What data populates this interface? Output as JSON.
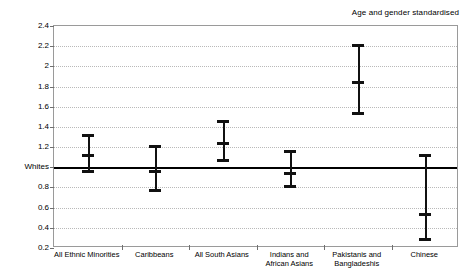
{
  "chart_data": {
    "type": "scatter",
    "title": "",
    "subtitle": "",
    "annotation": "Age and gender standardised",
    "xlabel": "",
    "ylabel": "",
    "ylim": [
      0.2,
      2.4
    ],
    "yticks": [
      0.2,
      0.4,
      0.6,
      0.8,
      1.0,
      1.2,
      1.4,
      1.6,
      1.8,
      2.0,
      2.2,
      2.4
    ],
    "ytick_labels": [
      "0.2",
      "0.4",
      "0.6",
      "0.8",
      "Whites",
      "1.2",
      "1.4",
      "1.6",
      "1.8",
      "2",
      "2.2",
      "2.4"
    ],
    "reference_line": {
      "value": 1.0,
      "label": "Whites",
      "color": "#000000"
    },
    "grid": "horizontal-dotted",
    "legend": "none",
    "categories": [
      "All Ethnic Minorities",
      "Caribbeans",
      "All South Asians",
      "Indians and\nAfrican Asians",
      "Pakistanis and\nBangladeshis",
      "Chinese"
    ],
    "series": [
      {
        "name": "Relative risk",
        "marker_color": "#111111",
        "values": [
          1.13,
          0.97,
          1.25,
          0.95,
          1.85,
          0.55
        ],
        "ci_low": [
          0.94,
          0.75,
          1.05,
          0.79,
          1.52,
          0.27
        ],
        "ci_high": [
          1.33,
          1.22,
          1.47,
          1.17,
          2.22,
          1.13
        ]
      }
    ]
  }
}
